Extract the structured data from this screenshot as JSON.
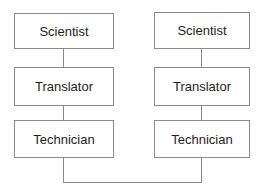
{
  "diagram": {
    "columns": [
      {
        "nodes": [
          {
            "label": "Scientist"
          },
          {
            "label": "Translator"
          },
          {
            "label": "Technician"
          }
        ]
      },
      {
        "nodes": [
          {
            "label": "Scientist"
          },
          {
            "label": "Translator"
          },
          {
            "label": "Technician"
          }
        ]
      }
    ],
    "edges": [
      {
        "from": "left-scientist",
        "to": "left-translator"
      },
      {
        "from": "left-translator",
        "to": "left-technician"
      },
      {
        "from": "right-scientist",
        "to": "right-translator"
      },
      {
        "from": "right-translator",
        "to": "right-technician"
      },
      {
        "from": "left-technician",
        "to": "right-technician"
      }
    ],
    "colors": {
      "stroke": "#8a8a8a",
      "text": "#1e1e1e",
      "background": "#ffffff"
    }
  }
}
